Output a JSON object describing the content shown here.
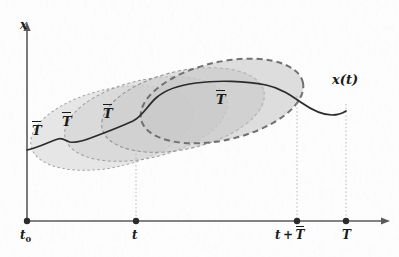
{
  "figure": {
    "type": "diagram",
    "axes": {
      "y_label": "x",
      "x_label": "",
      "origin_label": "t_0"
    },
    "x_ticks": [
      {
        "id": "t0",
        "label_main": "t",
        "label_sub": "0",
        "x": 27
      },
      {
        "id": "t",
        "label_main": "t",
        "label_sub": "",
        "x": 136
      },
      {
        "id": "t_plus_Tbar",
        "label_main": "t + T",
        "label_sub": "",
        "x": 297
      },
      {
        "id": "T",
        "label_main": "T",
        "label_sub": "",
        "x": 346
      }
    ],
    "tick_labels": {
      "t0": "t₀",
      "t": "t",
      "t_plus_Tbar": "t + T̄",
      "T": "T"
    },
    "window_label": "T",
    "window_labels": [
      {
        "id": "window-1",
        "text": "T",
        "x": 32,
        "y": 123
      },
      {
        "id": "window-2",
        "text": "T",
        "x": 62,
        "y": 114
      },
      {
        "id": "window-3",
        "text": "T",
        "x": 103,
        "y": 106
      },
      {
        "id": "window-4",
        "text": "T",
        "x": 216,
        "y": 92
      }
    ],
    "curve_label": "x(t)",
    "colors": {
      "axis": "#555555",
      "curve": "#2b2b2b",
      "ellipse_fill_light": "#d8d8d8",
      "ellipse_fill_mid": "#c9c9c9",
      "ellipse_fill_dark": "#bcbcbc",
      "ellipse_stroke_light": "#9a9a9a",
      "ellipse_stroke_bold": "#6e6e6e",
      "guide_dotted": "#b0b0b0",
      "text": "#1a1a1a",
      "background": "#fdfdfd"
    },
    "ellipses": [
      {
        "id": "window-ellipse-1",
        "cx": 112,
        "cy": 128,
        "rx": 83,
        "ry": 39,
        "rotate": -13,
        "bold": false
      },
      {
        "id": "window-ellipse-2",
        "cx": 146,
        "cy": 119,
        "rx": 83,
        "ry": 39,
        "rotate": -13,
        "bold": false
      },
      {
        "id": "window-ellipse-3",
        "cx": 183,
        "cy": 110,
        "rx": 83,
        "ry": 39,
        "rotate": -13,
        "bold": false
      },
      {
        "id": "window-ellipse-4",
        "cx": 222,
        "cy": 101,
        "rx": 83,
        "ry": 39,
        "rotate": -13,
        "bold": true
      }
    ],
    "guides": [
      {
        "id": "guide-t",
        "x": 136,
        "y_top": 150,
        "y_bottom": 221
      },
      {
        "id": "guide-t-plus-Tbar",
        "x": 297,
        "y_top": 96,
        "y_bottom": 221
      },
      {
        "id": "guide-T",
        "x": 346,
        "y_top": 104,
        "y_bottom": 221
      }
    ]
  }
}
